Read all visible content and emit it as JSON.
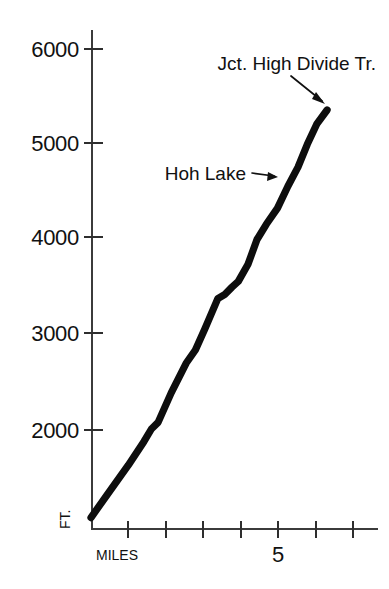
{
  "chart_data": {
    "type": "line",
    "title": "",
    "subtitle": "",
    "xlabel": "MILES",
    "ylabel": "FT.",
    "xlim": [
      0,
      7
    ],
    "ylim": [
      960,
      6200
    ],
    "grid": false,
    "legend": false,
    "legend_position": "none",
    "x_tick_labels": [
      "",
      "",
      "",
      "",
      "5",
      "",
      ""
    ],
    "x_tick_values": [
      1,
      2,
      3,
      4,
      5,
      6,
      7
    ],
    "y_tick_labels": [
      "2000",
      "3000",
      "4000",
      "5000",
      "6000"
    ],
    "y_tick_values": [
      2000,
      3000,
      4000,
      5000,
      6000
    ],
    "series": [
      {
        "name": "Hoh River Trail elevation profile",
        "x": [
          0.0,
          0.45,
          1.0,
          1.42,
          1.62,
          1.8,
          2.15,
          2.55,
          2.8,
          3.05,
          3.4,
          3.58,
          3.78,
          3.95,
          4.21,
          4.45,
          4.7,
          5.0,
          5.28,
          5.55,
          5.8,
          6.05,
          6.33
        ],
        "y": [
          1080,
          1330,
          1630,
          1880,
          2010,
          2080,
          2390,
          2700,
          2840,
          3060,
          3380,
          3420,
          3500,
          3560,
          3740,
          4000,
          4160,
          4330,
          4560,
          4760,
          5000,
          5210,
          5360
        ]
      }
    ],
    "annotations": [
      {
        "label": "Jct. High Divide Tr.",
        "x": 6.33,
        "y": 5360,
        "text_anchor": "end"
      },
      {
        "label": "Hoh Lake",
        "x": 5.0,
        "y": 4560,
        "text_anchor": "end"
      }
    ],
    "colors": {
      "line": "#0d0d0d",
      "axis": "#3b3b3b",
      "text": "#111111",
      "background": "#ffffff"
    }
  },
  "axis": {
    "y_unit_label": "FT.",
    "x_unit_label": "MILES",
    "y_labels": [
      "6000",
      "5000",
      "4000",
      "3000",
      "2000"
    ],
    "x_label_five": "5"
  },
  "annotations": {
    "junction": "Jct. High Divide Tr.",
    "hoh_lake": "Hoh Lake"
  }
}
